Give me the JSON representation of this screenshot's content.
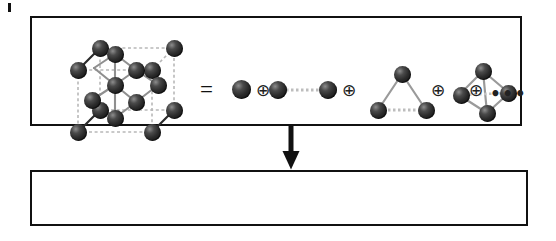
{
  "figure": {
    "type": "cluster-expansion-schematic",
    "panels": {
      "top": {
        "name": "lattice-decomposition",
        "equals_symbol": "=",
        "direct_sum_symbol": "⊕",
        "ellipsis": "•••",
        "lattice_label": "crystal-lattice",
        "lattice_atom_count": 14,
        "clusters": [
          {
            "order": 1,
            "name": "point-cluster",
            "atoms": 1
          },
          {
            "order": 2,
            "name": "pair-cluster",
            "atoms": 2
          },
          {
            "order": 3,
            "name": "triangle-cluster",
            "atoms": 3
          },
          {
            "order": 4,
            "name": "tetrahedron-cluster",
            "atoms": 4
          }
        ]
      },
      "bottom": {
        "name": "energy-expansion-equation",
        "lhs": "E",
        "equals": "=",
        "terms": [
          {
            "order": 1,
            "pi": "Π",
            "sub": "1",
            "dot": "·",
            "j": "J",
            "open": "(",
            "close": ")",
            "glyph": "point-cluster-glyph"
          },
          {
            "order": 2,
            "pi": "Π",
            "sub": "2",
            "dot": "·",
            "j": "J",
            "open": "(",
            "close": ")",
            "glyph": "pair-cluster-glyph"
          },
          {
            "order": 3,
            "pi": "Π",
            "sub": "3",
            "dot": "·",
            "j": "J",
            "open": "(",
            "close": ")",
            "glyph": "triangle-cluster-glyph"
          },
          {
            "order": 4,
            "pi": "Π",
            "sub": "4",
            "dot": "·",
            "j": "J",
            "open": "(",
            "close": ")",
            "glyph": "tetrahedron-cluster-glyph"
          }
        ],
        "plus": "+",
        "trailing_plus": "+",
        "trailing_ellipsis": "•••"
      }
    },
    "arrow": {
      "name": "downward-arrow",
      "direction": "down"
    },
    "colors": {
      "border": "#111111",
      "background": "#ffffff",
      "atom_dark": "#1b1b1b",
      "atom_highlight": "#8d8d8d",
      "bond_solid": "#8a8a8a",
      "bond_dashed": "#b4b4b4",
      "text": "#111111"
    }
  }
}
